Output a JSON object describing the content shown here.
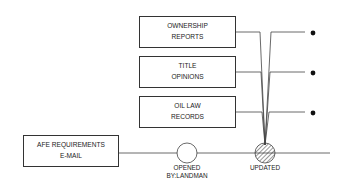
{
  "diagram": {
    "source_box": {
      "line1": "AFE REQUIREMENTS",
      "line2": "E-MAIL"
    },
    "document_boxes": [
      {
        "line1": "OWNERSHIP",
        "line2": "REPORTS"
      },
      {
        "line1": "TITLE",
        "line2": "OPINIONS"
      },
      {
        "line1": "OIL LAW",
        "line2": "RECORDS"
      }
    ],
    "nodes": [
      {
        "state": "open",
        "label_line1": "OPENED",
        "label_line2": "BY:LANDMAN"
      },
      {
        "state": "hatched",
        "label_line1": "UPDATED"
      }
    ],
    "colors": {
      "line": "#444444",
      "fill": "#ffffff",
      "bullet": "#111111"
    }
  }
}
